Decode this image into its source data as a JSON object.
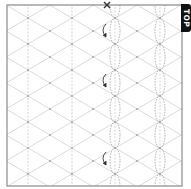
{
  "diagram": {
    "type": "crease-pattern",
    "label": "TOP",
    "colors": {
      "frame": "#8a8a8a",
      "grid": "#cfcfcf",
      "valley": "#9a9a9a",
      "arrow": "#333333",
      "tab_bg": "#111111",
      "tab_text": "#ffffff"
    },
    "frame": {
      "x": 7,
      "y": 5,
      "w": 175,
      "h": 181
    },
    "vertical_lines_x": [
      28,
      72,
      115,
      160
    ],
    "pleat_columns_x": [
      115,
      160
    ],
    "node_rows_y": [
      18,
      44,
      70,
      96,
      122,
      148,
      174
    ],
    "arrows_y": [
      30,
      80,
      158
    ],
    "start_marker": {
      "symbol": "x",
      "x": 107,
      "y": 5
    }
  }
}
